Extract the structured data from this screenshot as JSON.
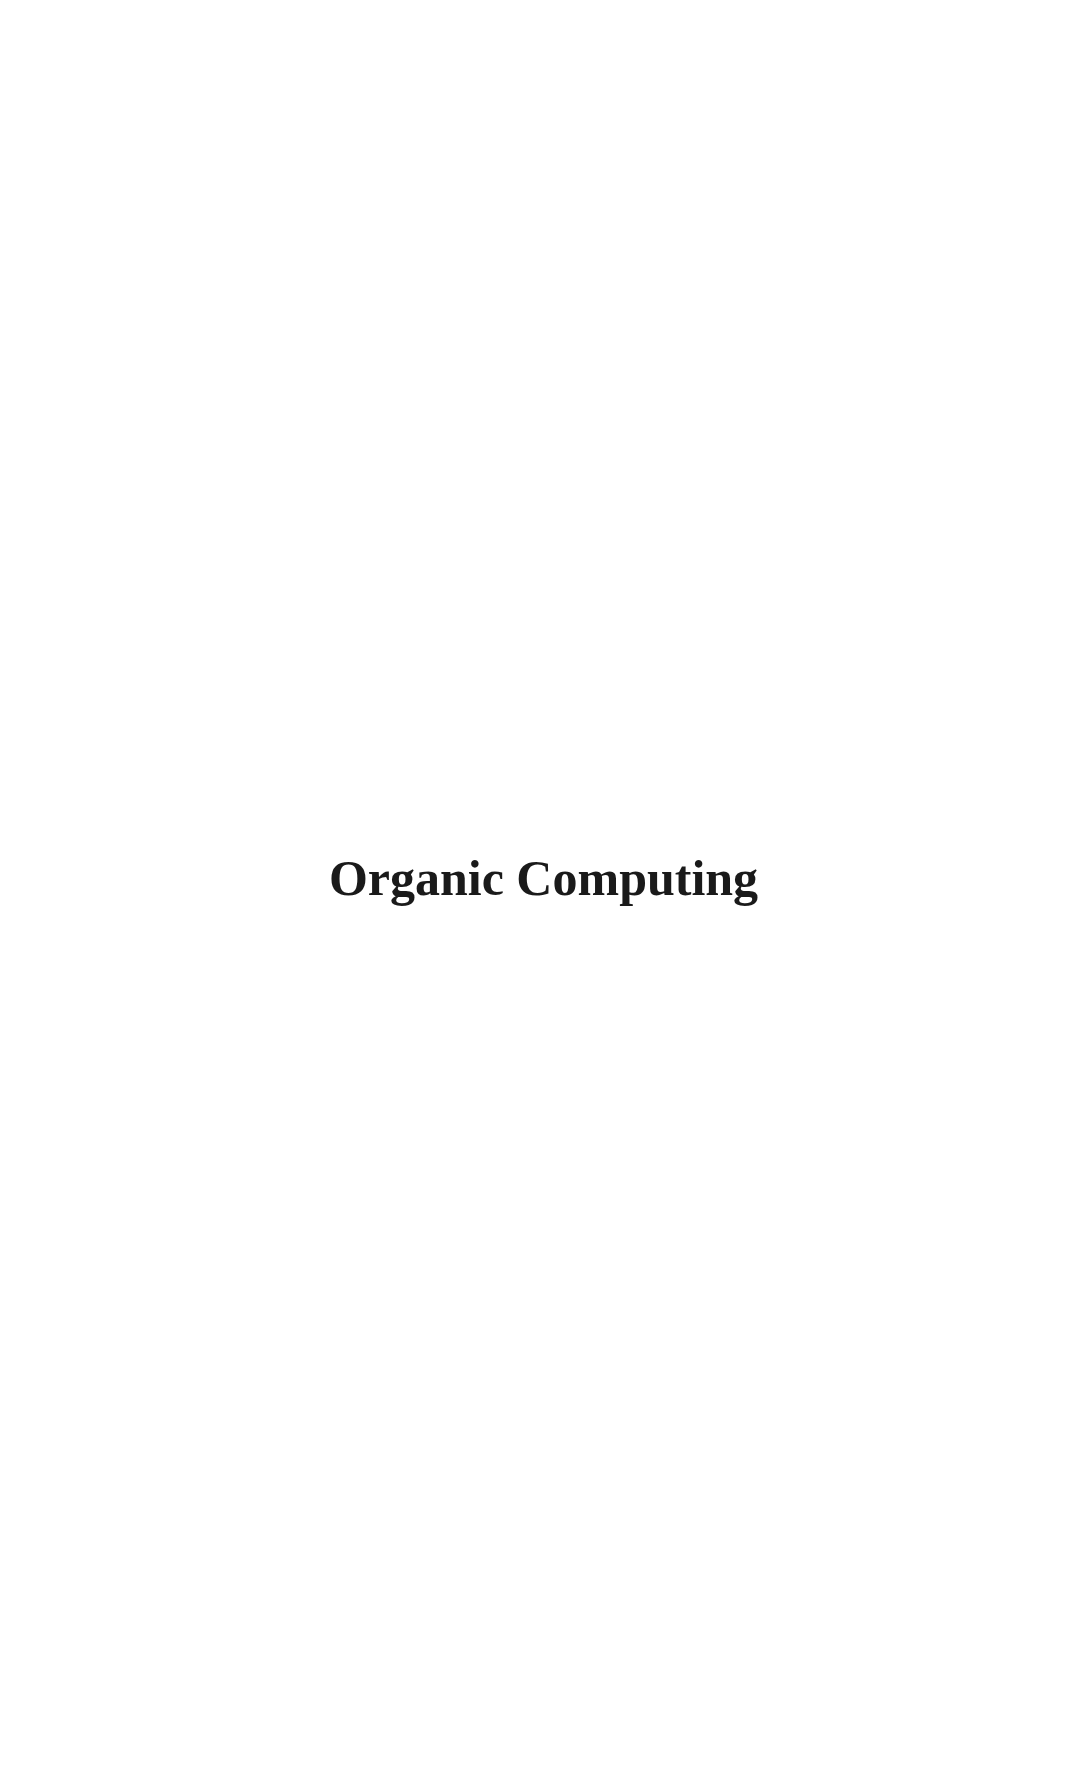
{
  "page": {
    "title": "Organic Computing"
  }
}
